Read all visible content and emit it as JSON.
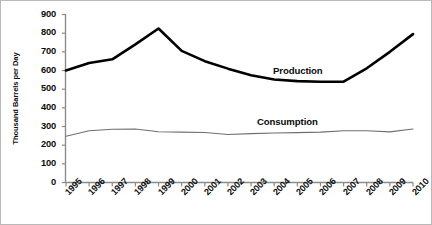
{
  "figure": {
    "background_color": "#ffffff",
    "border_color": "#b9b9b9"
  },
  "axes": {
    "y_axis_title": "Thousand Barrels per Day",
    "y_tick_labels": [
      "900",
      "800",
      "700",
      "600",
      "500",
      "400",
      "300",
      "200",
      "100",
      "0"
    ],
    "x_tick_labels": [
      "1995",
      "1996",
      "1997",
      "1998",
      "1999",
      "2000",
      "2001",
      "2002",
      "2003",
      "2004",
      "2005",
      "2006",
      "2007",
      "2008",
      "2009",
      "2010"
    ]
  },
  "annotations": {
    "production_label": "Production",
    "consumption_label": "Consumption"
  },
  "chart_data": {
    "type": "line",
    "title": "",
    "xlabel": "",
    "ylabel": "Thousand Barrels per Day",
    "ylim": [
      0,
      900
    ],
    "ytick_step": 100,
    "grid": false,
    "legend_position": "inline-annotation",
    "categories": [
      "1995",
      "1996",
      "1997",
      "1998",
      "1999",
      "2000",
      "2001",
      "2002",
      "2003",
      "2004",
      "2005",
      "2006",
      "2007",
      "2008",
      "2009",
      "2010"
    ],
    "series": [
      {
        "name": "Production",
        "color": "#000000",
        "line_width": 2.6,
        "values": [
          600,
          640,
          660,
          740,
          825,
          705,
          650,
          610,
          575,
          552,
          543,
          540,
          540,
          612,
          700,
          795
        ]
      },
      {
        "name": "Consumption",
        "color": "#6f6f6f",
        "line_width": 1.1,
        "values": [
          248,
          277,
          285,
          287,
          272,
          270,
          268,
          257,
          262,
          265,
          267,
          270,
          277,
          277,
          271,
          287
        ]
      }
    ]
  }
}
